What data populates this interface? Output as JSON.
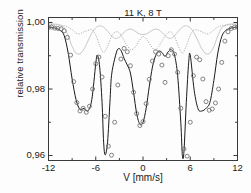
{
  "figure": {
    "annotation": "11 K, 8 T",
    "background": "#fdfdfd"
  },
  "chart_data": {
    "type": "line",
    "title": "",
    "annotation": "11 K, 8 T",
    "xlabel": "V [mm/s]",
    "ylabel": "relative transmission",
    "xlim": [
      -12,
      12
    ],
    "ylim": [
      0.9585,
      1.0015
    ],
    "grid": false,
    "legend": null,
    "xticks": [
      -12,
      -6,
      0,
      6,
      12
    ],
    "xticklabels": [
      "-12",
      "-6",
      "0",
      "6",
      "12"
    ],
    "xminorticks": [
      -9,
      -3,
      3,
      9
    ],
    "yticks": [
      1.0,
      0.98,
      0.96
    ],
    "yticklabels": [
      "1,00",
      "0,98",
      "0,96"
    ],
    "yminorticks": [
      0.99,
      0.97
    ],
    "colors": {
      "data_marker": "#6e6e6e",
      "fit_line": "#1a1a1a",
      "subspectrum_dotted": "#a8a8a8",
      "subspectrum_solid": "#c2c2c2",
      "axis": "#3a3a3a"
    },
    "series": [
      {
        "name": "measured data",
        "style": "open-circles",
        "x": [
          -12.0,
          -11.6,
          -11.2,
          -10.8,
          -10.4,
          -10.0,
          -9.6,
          -9.2,
          -8.8,
          -8.4,
          -8.0,
          -7.6,
          -7.2,
          -6.8,
          -6.4,
          -6.0,
          -5.6,
          -5.2,
          -4.8,
          -4.4,
          -4.0,
          -3.6,
          -3.2,
          -2.8,
          -2.4,
          -2.0,
          -1.6,
          -1.2,
          -0.8,
          -0.4,
          0.0,
          0.4,
          0.8,
          1.2,
          1.6,
          2.0,
          2.4,
          2.8,
          3.2,
          3.6,
          4.0,
          4.4,
          4.8,
          5.2,
          5.6,
          6.0,
          6.4,
          6.8,
          7.2,
          7.6,
          8.0,
          8.4,
          8.8,
          9.2,
          9.6,
          10.0,
          10.4,
          10.8,
          11.2,
          11.6,
          12.0
        ],
        "y": [
          0.9985,
          0.9986,
          0.9983,
          0.9982,
          0.9981,
          0.9975,
          0.9955,
          0.9902,
          0.9822,
          0.9759,
          0.9734,
          0.9742,
          0.973,
          0.9748,
          0.98,
          0.9876,
          0.9896,
          0.9836,
          0.9718,
          0.9628,
          0.9601,
          0.97,
          0.9812,
          0.989,
          0.9922,
          0.9912,
          0.987,
          0.979,
          0.9726,
          0.969,
          0.9702,
          0.9756,
          0.9829,
          0.9884,
          0.9912,
          0.9905,
          0.9872,
          0.982,
          0.99,
          0.9918,
          0.9905,
          0.985,
          0.9742,
          0.962,
          0.9598,
          0.97,
          0.984,
          0.9896,
          0.9888,
          0.983,
          0.9762,
          0.9736,
          0.974,
          0.9758,
          0.98,
          0.988,
          0.9944,
          0.9972,
          0.9982,
          0.9985,
          0.9986
        ]
      },
      {
        "name": "total fit",
        "style": "solid",
        "x": [
          -12.0,
          -11.5,
          -11.0,
          -10.5,
          -10.0,
          -9.5,
          -9.0,
          -8.5,
          -8.0,
          -7.5,
          -7.0,
          -6.5,
          -6.0,
          -5.8,
          -5.5,
          -5.2,
          -5.0,
          -4.8,
          -4.5,
          -4.2,
          -4.0,
          -3.6,
          -3.2,
          -2.8,
          -2.4,
          -2.0,
          -1.6,
          -1.2,
          -0.8,
          -0.4,
          0.0,
          0.4,
          0.8,
          1.2,
          1.6,
          2.0,
          2.4,
          2.8,
          3.2,
          3.6,
          4.0,
          4.4,
          4.8,
          5.0,
          5.2,
          5.5,
          5.8,
          6.0,
          6.5,
          7.0,
          7.5,
          8.0,
          8.5,
          9.0,
          9.5,
          10.0,
          10.5,
          11.0,
          11.5,
          12.0
        ],
        "y": [
          0.9986,
          0.9985,
          0.9982,
          0.9976,
          0.996,
          0.9908,
          0.983,
          0.9768,
          0.9738,
          0.9742,
          0.9734,
          0.9768,
          0.9876,
          0.9902,
          0.9866,
          0.976,
          0.964,
          0.9602,
          0.964,
          0.976,
          0.984,
          0.989,
          0.992,
          0.9916,
          0.9892,
          0.9872,
          0.9848,
          0.979,
          0.9726,
          0.9694,
          0.97,
          0.9742,
          0.9808,
          0.9866,
          0.99,
          0.9914,
          0.991,
          0.9898,
          0.9912,
          0.9918,
          0.9902,
          0.984,
          0.97,
          0.96,
          0.9612,
          0.976,
          0.988,
          0.9902,
          0.9796,
          0.974,
          0.9734,
          0.9742,
          0.976,
          0.9826,
          0.9908,
          0.9958,
          0.9976,
          0.9982,
          0.9985,
          0.9986
        ]
      },
      {
        "name": "subspectrum A (dotted)",
        "style": "dotted",
        "x": [
          -12.0,
          -11.0,
          -10.0,
          -9.5,
          -9.0,
          -8.5,
          -8.0,
          -7.5,
          -7.0,
          -6.5,
          -6.0,
          -5.5,
          -5.0,
          -4.5,
          -4.0,
          -3.5,
          -3.0,
          -2.5,
          -2.0,
          -1.5,
          -1.0,
          -0.5,
          0.0,
          0.5,
          1.0,
          1.5,
          2.0,
          2.5,
          3.0,
          3.5,
          4.0,
          4.5,
          5.0,
          5.5,
          6.0,
          6.5,
          7.0,
          7.5,
          8.0,
          8.5,
          9.0,
          9.5,
          10.0,
          11.0,
          12.0
        ],
        "y": [
          0.9994,
          0.9993,
          0.999,
          0.9986,
          0.9978,
          0.9968,
          0.9966,
          0.9972,
          0.9976,
          0.9978,
          0.9962,
          0.993,
          0.991,
          0.9928,
          0.9958,
          0.9972,
          0.9968,
          0.995,
          0.993,
          0.9918,
          0.9926,
          0.9944,
          0.9958,
          0.9948,
          0.993,
          0.9918,
          0.9928,
          0.9948,
          0.9966,
          0.9972,
          0.9958,
          0.9928,
          0.9908,
          0.993,
          0.9962,
          0.9978,
          0.9976,
          0.9972,
          0.9966,
          0.9968,
          0.9978,
          0.9986,
          0.999,
          0.9993,
          0.9994
        ]
      },
      {
        "name": "subspectrum B (light solid)",
        "style": "light-solid",
        "x": [
          -12.0,
          -11.0,
          -10.5,
          -10.0,
          -9.5,
          -9.0,
          -8.5,
          -8.0,
          -7.5,
          -7.0,
          -6.5,
          -6.0,
          -5.5,
          -5.0,
          -4.5,
          -4.0,
          -3.5,
          -3.0,
          -2.5,
          -2.0,
          -1.5,
          -1.0,
          -0.5,
          0.0,
          0.5,
          1.0,
          1.5,
          2.0,
          2.5,
          3.0,
          3.5,
          4.0,
          4.5,
          5.0,
          5.5,
          6.0,
          6.5,
          7.0,
          7.5,
          8.0,
          8.5,
          9.0,
          9.5,
          10.0,
          10.5,
          11.0,
          12.0
        ],
        "y": [
          0.9996,
          0.9995,
          0.9992,
          0.9984,
          0.996,
          0.9928,
          0.9908,
          0.9906,
          0.992,
          0.9944,
          0.9968,
          0.9984,
          0.999,
          0.9986,
          0.9974,
          0.996,
          0.9952,
          0.9956,
          0.9968,
          0.9978,
          0.998,
          0.9974,
          0.9966,
          0.9964,
          0.9966,
          0.9974,
          0.998,
          0.9978,
          0.9968,
          0.9956,
          0.9952,
          0.996,
          0.9974,
          0.9986,
          0.999,
          0.9984,
          0.9968,
          0.9944,
          0.992,
          0.9906,
          0.9908,
          0.9928,
          0.996,
          0.9984,
          0.9992,
          0.9995,
          0.9996
        ]
      }
    ]
  }
}
